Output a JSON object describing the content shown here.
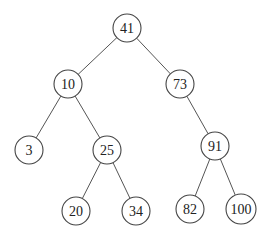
{
  "diagram": {
    "type": "binary-search-tree",
    "nodes": [
      {
        "id": "n41",
        "value": "41",
        "x": 127,
        "y": 28,
        "r": 14
      },
      {
        "id": "n10",
        "value": "10",
        "x": 68,
        "y": 84,
        "r": 14
      },
      {
        "id": "n73",
        "value": "73",
        "x": 180,
        "y": 84,
        "r": 14
      },
      {
        "id": "n3",
        "value": "3",
        "x": 29,
        "y": 150,
        "r": 14
      },
      {
        "id": "n25",
        "value": "25",
        "x": 107,
        "y": 150,
        "r": 14
      },
      {
        "id": "n91",
        "value": "91",
        "x": 215,
        "y": 146,
        "r": 14
      },
      {
        "id": "n20",
        "value": "20",
        "x": 76,
        "y": 211,
        "r": 14
      },
      {
        "id": "n34",
        "value": "34",
        "x": 136,
        "y": 211,
        "r": 14
      },
      {
        "id": "n82",
        "value": "82",
        "x": 190,
        "y": 209,
        "r": 14
      },
      {
        "id": "n100",
        "value": "100",
        "x": 241,
        "y": 209,
        "r": 15
      }
    ],
    "edges": [
      {
        "from": "n41",
        "to": "n10"
      },
      {
        "from": "n41",
        "to": "n73"
      },
      {
        "from": "n10",
        "to": "n3"
      },
      {
        "from": "n10",
        "to": "n25"
      },
      {
        "from": "n73",
        "to": "n91"
      },
      {
        "from": "n25",
        "to": "n20"
      },
      {
        "from": "n25",
        "to": "n34"
      },
      {
        "from": "n91",
        "to": "n82"
      },
      {
        "from": "n91",
        "to": "n100"
      }
    ]
  }
}
